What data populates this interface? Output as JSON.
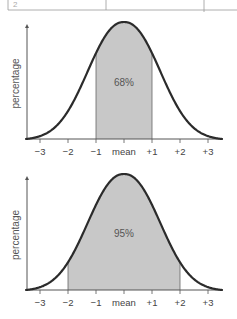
{
  "table_fragment": {
    "first_cell_text": "2"
  },
  "chart_data": [
    {
      "type": "area",
      "title": "",
      "xlabel": "",
      "ylabel": "percentage",
      "x_ticks": [
        "−3",
        "−2",
        "−1",
        "mean",
        "+1",
        "+2",
        "+3"
      ],
      "x_tick_values": [
        -3,
        -2,
        -1,
        0,
        1,
        2,
        3
      ],
      "xlim": [
        -3.5,
        3.5
      ],
      "curve": "normal distribution (bell curve)",
      "shaded_range": [
        -1,
        1
      ],
      "shaded_label": "68%",
      "colors": {
        "curve": "#2b2b2b",
        "fill": "#c8c8c8",
        "axis": "#555555"
      },
      "grid": false
    },
    {
      "type": "area",
      "title": "",
      "xlabel": "",
      "ylabel": "percentage",
      "x_ticks": [
        "−3",
        "−2",
        "−1",
        "mean",
        "+1",
        "+2",
        "+3"
      ],
      "x_tick_values": [
        -3,
        -2,
        -1,
        0,
        1,
        2,
        3
      ],
      "xlim": [
        -3.5,
        3.5
      ],
      "curve": "normal distribution (bell curve)",
      "shaded_range": [
        -2,
        2
      ],
      "shaded_label": "95%",
      "colors": {
        "curve": "#2b2b2b",
        "fill": "#c8c8c8",
        "axis": "#555555"
      },
      "grid": false
    }
  ]
}
